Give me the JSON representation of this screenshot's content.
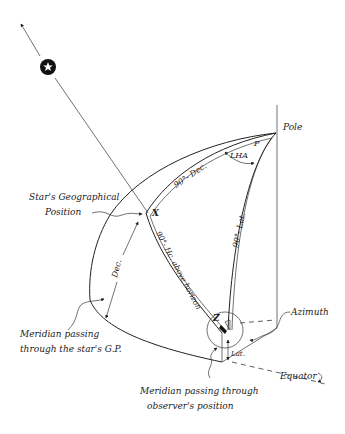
{
  "diagram": {
    "labels": {
      "pole": "Pole",
      "p": "P",
      "lha": "LHA",
      "ninety_minus_dec": "90°- Dec.",
      "ninety_minus_lat": "90°- Lat.",
      "ninety_minus_hc": "90°- Hc. above horizon",
      "x": "X",
      "z": "Z",
      "dec": "Dec.",
      "lat": "Lat.",
      "azimuth": "Azimuth",
      "equator": "Equator",
      "stars_gp_line1": "Star's Geographical",
      "stars_gp_line2": "Position",
      "meridian_star_line1": "Meridian passing",
      "meridian_star_line2": "through the star's G.P.",
      "meridian_obs_line1": "Meridian passing through",
      "meridian_obs_line2": "observer's position"
    },
    "icons": {
      "star": "star-icon"
    },
    "colors": {
      "ink": "#222222",
      "background": "#ffffff"
    }
  }
}
